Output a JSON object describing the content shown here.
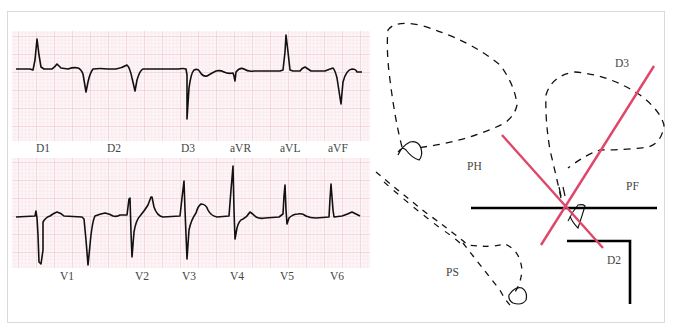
{
  "colors": {
    "frame": "#d8d8d8",
    "grid_fine": "#f6dde3",
    "grid_major": "#eec3cd",
    "grid_bg": "#fdf4f6",
    "trace": "#111111",
    "axis_red": "#e0456a",
    "axis_black": "#000000",
    "label": "#444444"
  },
  "ecg": {
    "limb_leads": {
      "labels": [
        "D1",
        "D2",
        "D3",
        "aVR",
        "aVL",
        "aVF"
      ],
      "label_x": [
        43,
        115,
        188,
        240,
        289,
        339
      ]
    },
    "precordial_leads": {
      "labels": [
        "V1",
        "V2",
        "V3",
        "V4",
        "V5",
        "V6"
      ],
      "label_x": [
        66,
        142,
        189,
        237,
        287,
        337
      ]
    }
  },
  "vectorcardiogram": {
    "plane_labels": {
      "horizontal": "PH",
      "frontal": "PF",
      "sagittal": "PS"
    },
    "axis_labels": {
      "d3": "D3",
      "d2": "D2"
    }
  }
}
